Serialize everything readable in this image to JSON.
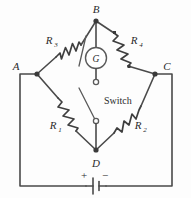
{
  "figure": {
    "background_color": "#fdfdfd",
    "line_color": "#4a4a4a"
  },
  "nodes": [
    {
      "id": "A",
      "label": "A",
      "x": 37,
      "y": 74,
      "label_x": 16,
      "label_y": 70
    },
    {
      "id": "B",
      "label": "B",
      "x": 96,
      "y": 21,
      "label_x": 92,
      "label_y": 12
    },
    {
      "id": "C",
      "label": "C",
      "x": 155,
      "y": 74,
      "label_x": 166,
      "label_y": 70
    },
    {
      "id": "D",
      "label": "D",
      "x": 96,
      "y": 150,
      "label_x": 92,
      "label_y": 166
    }
  ],
  "resistors": [
    {
      "id": "R3",
      "label": "R",
      "subscript": "3",
      "branch": "A-B",
      "variable": true,
      "label_x": 50,
      "label_y": 44
    },
    {
      "id": "R4",
      "label": "R",
      "subscript": "4",
      "branch": "B-C",
      "variable": false,
      "label_x": 134,
      "label_y": 44
    },
    {
      "id": "R1",
      "label": "R",
      "subscript": "1",
      "branch": "A-D",
      "variable": false,
      "label_x": 54,
      "label_y": 128
    },
    {
      "id": "R2",
      "label": "R",
      "subscript": "2",
      "branch": "D-C",
      "variable": false,
      "label_x": 132,
      "label_y": 128
    }
  ],
  "galvanometer": {
    "label": "G",
    "x": 96,
    "y": 58,
    "radius": 10.5
  },
  "switch": {
    "label": "Switch",
    "label_x": 104,
    "label_y": 104,
    "top_terminal": {
      "x": 96,
      "y": 82
    },
    "bottom_terminal": {
      "x": 96,
      "y": 121
    },
    "state": "open"
  },
  "battery": {
    "plus_label": "+",
    "minus_label": "−",
    "plus_x": 84,
    "plus_y": 176,
    "minus_x": 104,
    "minus_y": 176,
    "x": 96,
    "y": 186
  },
  "outer_loop": {
    "left_x": 20,
    "right_x": 172,
    "bottom_y": 186,
    "top_left_y": 74,
    "top_right_y": 74
  }
}
